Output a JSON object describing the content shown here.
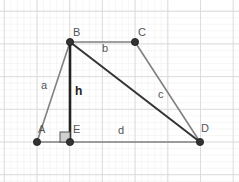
{
  "diagram": {
    "grid": {
      "major_spacing": 32.7,
      "minor_divisions": 5,
      "origin_x": 37,
      "origin_y": 142,
      "major_color": "#d9d9d9",
      "minor_color": "#f0f0f0"
    },
    "points": [
      {
        "id": "A",
        "label": "A",
        "x": 37,
        "y": 142
      },
      {
        "id": "B",
        "label": "B",
        "x": 70,
        "y": 42
      },
      {
        "id": "C",
        "label": "C",
        "x": 135,
        "y": 42
      },
      {
        "id": "D",
        "label": "D",
        "x": 200,
        "y": 142
      },
      {
        "id": "E",
        "label": "E",
        "x": 70,
        "y": 142
      }
    ],
    "segments": [
      {
        "id": "a",
        "label": "a",
        "from": "A",
        "to": "B",
        "color": "#808080",
        "width": 1.6
      },
      {
        "id": "b",
        "label": "b",
        "from": "B",
        "to": "C",
        "color": "#808080",
        "width": 1.6
      },
      {
        "id": "c",
        "label": "c",
        "from": "C",
        "to": "D",
        "color": "#808080",
        "width": 1.6
      },
      {
        "id": "d",
        "label": "d",
        "from": "A",
        "to": "D",
        "color": "#808080",
        "width": 1.6
      },
      {
        "id": "h",
        "label": "h",
        "from": "B",
        "to": "E",
        "color": "#222222",
        "width": 2.6
      },
      {
        "id": "BD",
        "label": "",
        "from": "B",
        "to": "D",
        "color": "#333333",
        "width": 2.0
      }
    ],
    "right_angle": {
      "at": "E",
      "size": 10,
      "fill": "#d0d0d0",
      "stroke": "#555555"
    },
    "labels": {
      "A": "A",
      "B": "B",
      "C": "C",
      "D": "D",
      "E": "E",
      "a": "a",
      "b": "b",
      "c": "c",
      "d": "d",
      "h": "h"
    },
    "point_color": "#333333"
  }
}
